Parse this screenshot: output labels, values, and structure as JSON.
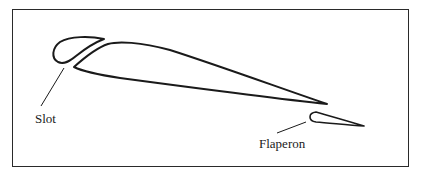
{
  "diagram": {
    "type": "airfoil-cross-section",
    "labels": {
      "slot": "Slot",
      "flaperon": "Flaperon"
    },
    "components": [
      {
        "name": "leading-edge-slat",
        "shape": "teardrop"
      },
      {
        "name": "main-wing",
        "shape": "airfoil"
      },
      {
        "name": "flaperon",
        "shape": "teardrop"
      }
    ],
    "colors": {
      "stroke": "#1a1a1a",
      "background": "#ffffff",
      "frame": "#2a2a2a"
    }
  }
}
